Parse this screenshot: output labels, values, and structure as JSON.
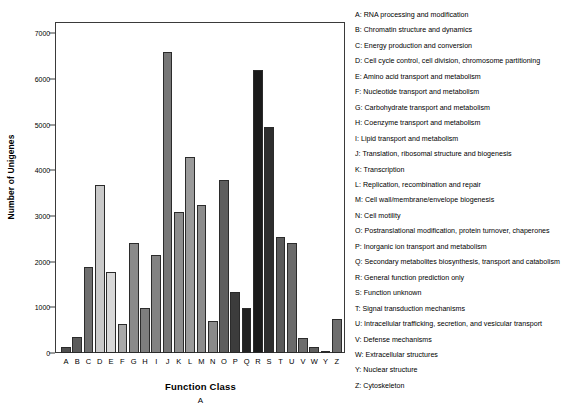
{
  "chart_data": {
    "type": "bar",
    "title": "",
    "xlabel": "Function Class",
    "ylabel": "Number of Unigenes",
    "panel_caption": "A",
    "ylim": [
      0,
      7250
    ],
    "yticks": [
      0,
      1000,
      2000,
      3000,
      4000,
      5000,
      6000,
      7000
    ],
    "ytick_labels": [
      "0",
      "1000",
      "2000",
      "3000",
      "4000",
      "5000",
      "6000",
      "7000"
    ],
    "grid": false,
    "legend_position": "right",
    "categories": [
      "A",
      "B",
      "C",
      "D",
      "E",
      "F",
      "G",
      "H",
      "I",
      "J",
      "K",
      "L",
      "M",
      "N",
      "O",
      "P",
      "Q",
      "R",
      "S",
      "T",
      "U",
      "V",
      "W",
      "Y",
      "Z"
    ],
    "values": [
      130,
      350,
      1890,
      3680,
      1780,
      630,
      2410,
      980,
      2150,
      6600,
      3090,
      4300,
      3250,
      700,
      3800,
      1340,
      990,
      6200,
      4950,
      2550,
      2400,
      330,
      140,
      20,
      750
    ],
    "bar_colors": [
      "#4f4f4f",
      "#5a5a5a",
      "#6e6e6e",
      "#c9c9c9",
      "#d8d8d8",
      "#a8a8a8",
      "#8a8a8a",
      "#7d7d7d",
      "#828282",
      "#777777",
      "#8e8e8e",
      "#9a9a9a",
      "#8c8c8c",
      "#8a8a8a",
      "#5e5e5e",
      "#3c3c3c",
      "#222222",
      "#1a1a1a",
      "#2e2e2e",
      "#5a5a5a",
      "#6a6a6a",
      "#6e6e6e",
      "#5e5e5e",
      "#6a6a6a",
      "#6e6e6e"
    ]
  },
  "legend": {
    "items": [
      "A: RNA processing and modification",
      "B: Chromatin structure and dynamics",
      "C: Energy production and conversion",
      "D: Cell cycle control, cell division, chromosome partitioning",
      "E: Amino acid transport and metabolism",
      "F: Nucleotide transport and metabolism",
      "G: Carbohydrate transport and metabolism",
      "H: Coenzyme transport and metabolism",
      "I: Lipid transport and metabolism",
      "J: Translation, ribosomal structure and biogenesis",
      "K: Transcription",
      "L: Replication, recombination and repair",
      "M: Cell wall/membrane/envelope biogenesis",
      "N: Cell motility",
      "O: Postranslational modification, protein turnover, chaperones",
      "P: Inorganic ion transport and metabolism",
      "Q: Secondary metabolites biosynthesis, transport and catabolism",
      "R: General function prediction only",
      "S: Function unknown",
      "T: Signal transduction mechanisms",
      "U: Intracellular trafficking, secretion, and vesicular transport",
      "V: Defense mechanisms",
      "W: Extracellular structures",
      "Y: Nuclear structure",
      "Z: Cytoskeleton"
    ]
  }
}
